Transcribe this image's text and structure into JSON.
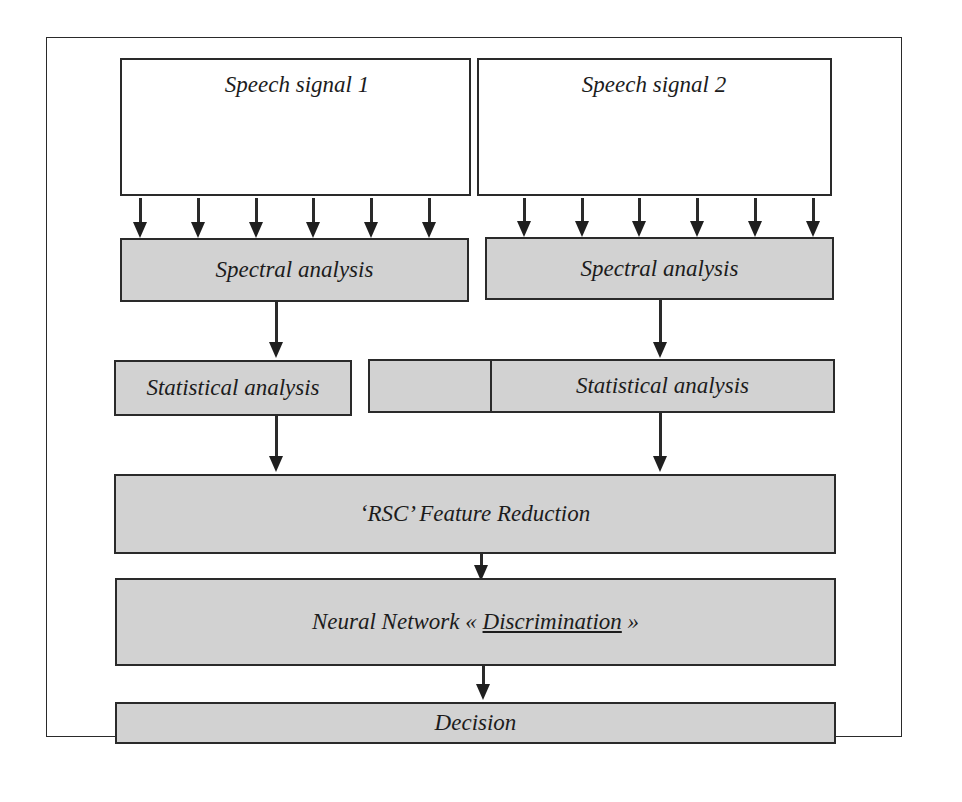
{
  "diagram": {
    "type": "flowchart",
    "inputs": [
      {
        "id": "speech-signal-1",
        "label": "Speech signal 1"
      },
      {
        "id": "speech-signal-2",
        "label": "Speech signal 2"
      }
    ],
    "branches": [
      {
        "spectral": "Spectral analysis",
        "statistical": "Statistical analysis",
        "input_arrow_count": 6
      },
      {
        "spectral": "Spectral analysis",
        "statistical": "Statistical analysis",
        "input_arrow_count": 6
      }
    ],
    "feature_reduction": "‘RSC’ Feature Reduction",
    "neural_network": {
      "prefix": "Neural Network « ",
      "emphasis": "Discrimination",
      "suffix": " »"
    },
    "decision": "Decision",
    "colors": {
      "process_fill": "#d2d2d2",
      "input_fill": "#ffffff",
      "stroke": "#2a2a2a"
    },
    "edges": [
      {
        "from": "Speech signal 1",
        "to": "Spectral analysis (1)",
        "count": 6
      },
      {
        "from": "Speech signal 2",
        "to": "Spectral analysis (2)",
        "count": 6
      },
      {
        "from": "Spectral analysis (1)",
        "to": "Statistical analysis (1)"
      },
      {
        "from": "Spectral analysis (2)",
        "to": "Statistical analysis (2)"
      },
      {
        "from": "Statistical analysis (1)",
        "to": "‘RSC’ Feature Reduction"
      },
      {
        "from": "Statistical analysis (2)",
        "to": "‘RSC’ Feature Reduction"
      },
      {
        "from": "‘RSC’ Feature Reduction",
        "to": "Neural Network « Discrimination »"
      },
      {
        "from": "Neural Network « Discrimination »",
        "to": "Decision"
      }
    ]
  }
}
